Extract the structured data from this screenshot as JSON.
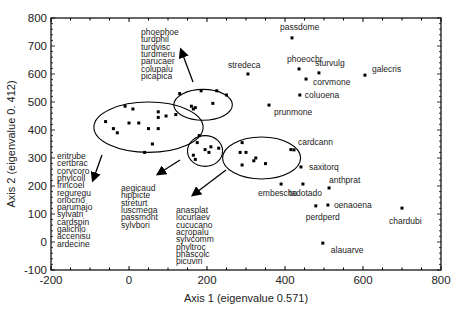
{
  "chart_data": {
    "type": "scatter",
    "title": "",
    "xlabel": "Axis 1 (eigenvalue 0.571)",
    "ylabel": "Axis 2 (eigenvalue 0. 412)",
    "xlim": [
      -200,
      800
    ],
    "ylim": [
      -100,
      800
    ],
    "xticks": [
      -200,
      0,
      200,
      400,
      600,
      800
    ],
    "yticks": [
      -100,
      0,
      100,
      200,
      300,
      400,
      500,
      600,
      700,
      800
    ],
    "grid": false,
    "legend": null,
    "labeled_points": [
      {
        "label": "passdome",
        "x": 418,
        "y": 729
      },
      {
        "label": "stredeca",
        "x": 305,
        "y": 600
      },
      {
        "label": "phoeochr",
        "x": 436,
        "y": 618
      },
      {
        "label": "sturvulg",
        "x": 487,
        "y": 604
      },
      {
        "label": "corvmone",
        "x": 454,
        "y": 582
      },
      {
        "label": "galecris",
        "x": 605,
        "y": 596
      },
      {
        "label": "coluoena",
        "x": 438,
        "y": 525
      },
      {
        "label": "prunmone",
        "x": 359,
        "y": 489
      },
      {
        "label": "cardcann",
        "x": 423,
        "y": 329
      },
      {
        "label": "saxitorq",
        "x": 441,
        "y": 268
      },
      {
        "label": "embescho",
        "x": 390,
        "y": 207
      },
      {
        "label": "tadotado",
        "x": 446,
        "y": 207
      },
      {
        "label": "anthprat",
        "x": 513,
        "y": 193
      },
      {
        "label": "oenaoena",
        "x": 510,
        "y": 132
      },
      {
        "label": "perdperd",
        "x": 479,
        "y": 129
      },
      {
        "label": "chardubi",
        "x": 700,
        "y": 121
      },
      {
        "label": "alauarve",
        "x": 497,
        "y": -4
      }
    ],
    "clusters": [
      {
        "name": "cluster-left",
        "species": [
          "eritrube",
          "certbrac",
          "corvcoro",
          "phylcoll",
          "frincoel",
          "reguregu",
          "oriocrio",
          "parumajo",
          "sylvatri",
          "cardspin",
          "galichlo",
          "accenisu",
          "ardecine"
        ],
        "ellipse": {
          "cx": 50,
          "cy": 410,
          "rx": 140,
          "ry": 90
        },
        "points": [
          [
            -60,
            430
          ],
          [
            -40,
            405
          ],
          [
            -30,
            390
          ],
          [
            -10,
            485
          ],
          [
            0,
            425
          ],
          [
            10,
            475
          ],
          [
            25,
            425
          ],
          [
            50,
            405
          ],
          [
            75,
            405
          ],
          [
            75,
            445
          ],
          [
            75,
            465
          ],
          [
            95,
            450
          ],
          [
            120,
            455
          ],
          [
            60,
            350
          ],
          [
            40,
            320
          ]
        ]
      },
      {
        "name": "cluster-top",
        "species": [
          "phoephoe",
          "turdphil",
          "turdvisc",
          "turdmeru",
          "parucaer",
          "colupalu",
          "picapica"
        ],
        "ellipse": {
          "cx": 190,
          "cy": 490,
          "rx": 75,
          "ry": 55
        },
        "points": [
          [
            130,
            530
          ],
          [
            160,
            485
          ],
          [
            165,
            475
          ],
          [
            170,
            480
          ],
          [
            185,
            540
          ],
          [
            215,
            495
          ],
          [
            225,
            540
          ],
          [
            250,
            525
          ]
        ]
      },
      {
        "name": "cluster-middle",
        "species": [
          "aegicaud",
          "hippicte",
          "streturt",
          "luscmega",
          "passmont",
          "sylvbori"
        ],
        "ellipse": {
          "cx": 195,
          "cy": 325,
          "rx": 45,
          "ry": 55
        },
        "points": [
          [
            175,
            355
          ],
          [
            165,
            310
          ],
          [
            180,
            380
          ],
          [
            195,
            330
          ],
          [
            205,
            320
          ],
          [
            210,
            340
          ],
          [
            230,
            335
          ],
          [
            170,
            295
          ]
        ]
      },
      {
        "name": "cluster-right",
        "species": [
          "anasplat",
          "locunaev",
          "cucucano",
          "acropalu",
          "sylvcomm",
          "phyltroc",
          "phascolc",
          "picuviri"
        ],
        "ellipse": {
          "cx": 340,
          "cy": 300,
          "rx": 100,
          "ry": 75
        },
        "points": [
          [
            290,
            355
          ],
          [
            285,
            320
          ],
          [
            300,
            320
          ],
          [
            290,
            275
          ],
          [
            320,
            290
          ],
          [
            325,
            300
          ],
          [
            350,
            280
          ],
          [
            415,
            330
          ]
        ]
      }
    ]
  },
  "labels": {
    "xlabel": "Axis 1 (eigenvalue 0.571)",
    "ylabel": "Axis 2 (eigenvalue 0. 412)"
  }
}
